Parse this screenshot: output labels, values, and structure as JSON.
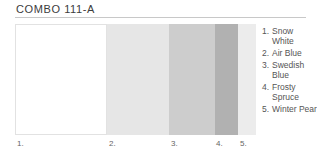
{
  "title": "COMBO 111-A",
  "swatches": [
    {
      "num": "1.",
      "name": "Snow White",
      "color": "#ffffff",
      "width": 92
    },
    {
      "num": "2.",
      "name": "Air Blue",
      "color": "#e6e6e6",
      "width": 62
    },
    {
      "num": "3.",
      "name": "Swedish Blue",
      "color": "#cdcdcd",
      "width": 46
    },
    {
      "num": "4.",
      "name": "Frosty Spruce",
      "color": "#b1b1b1",
      "width": 23
    },
    {
      "num": "5.",
      "name": "Winter Pear",
      "color": "#ececec",
      "width": 18
    }
  ],
  "legend": [
    {
      "num": "1.",
      "text": "Snow White"
    },
    {
      "num": "2.",
      "text": "Air Blue"
    },
    {
      "num": "3.",
      "text": "Swedish Blue"
    },
    {
      "num": "4.",
      "text": "Frosty Spruce"
    },
    {
      "num": "5.",
      "text": "Winter Pear"
    }
  ],
  "labels": [
    {
      "text": "1.",
      "x": 17
    },
    {
      "text": "2.",
      "x": 109
    },
    {
      "text": "3.",
      "x": 171
    },
    {
      "text": "4.",
      "x": 216
    },
    {
      "text": "5.",
      "x": 240
    }
  ]
}
